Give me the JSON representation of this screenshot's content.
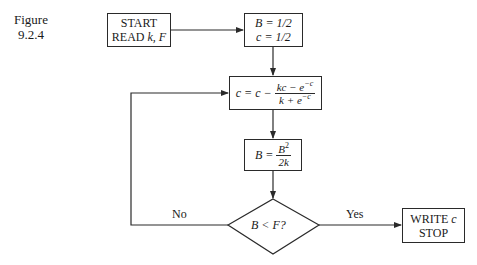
{
  "caption": {
    "line1": "Figure",
    "line2": "9.2.4"
  },
  "nodes": {
    "start": {
      "line1": "START",
      "line2_prefix": "READ ",
      "line2_vars": "k, F"
    },
    "init": {
      "line1": "B = 1/2",
      "line2": "c = 1/2"
    },
    "update_c": {
      "lhs": "c = c −",
      "numerator": "kc − e",
      "numerator_exp": "−c",
      "denominator": "k + e",
      "denominator_exp": "−c"
    },
    "update_b": {
      "lhs": "B =",
      "numerator": "B",
      "numerator_exp": "2",
      "denominator": "2k"
    },
    "decision": {
      "text": "B < F?"
    },
    "end": {
      "line1_prefix": "WRITE ",
      "line1_var": "c",
      "line2": "STOP"
    }
  },
  "edges": {
    "no_label": "No",
    "yes_label": "Yes"
  },
  "colors": {
    "line": "#2a2a2a",
    "background": "#ffffff"
  }
}
